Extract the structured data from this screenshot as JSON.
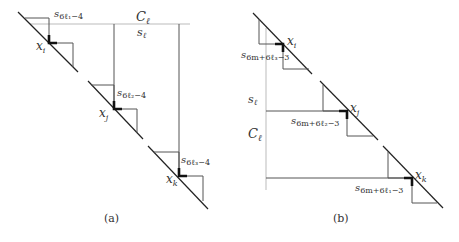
{
  "panel_a": {
    "caption": "(a)",
    "top_label": "C",
    "top_label_sub": "ℓ",
    "axis_label": "s",
    "axis_label_sub": "ℓ",
    "points": [
      {
        "name": "x",
        "sub": "i",
        "s_label": "s",
        "s_sub": "6ℓ₁−4"
      },
      {
        "name": "x",
        "sub": "j",
        "s_label": "s",
        "s_sub": "6ℓ₂−4"
      },
      {
        "name": "x",
        "sub": "k",
        "s_label": "s",
        "s_sub": "6ℓ₃−4"
      }
    ]
  },
  "panel_b": {
    "caption": "(b)",
    "side_label": "C",
    "side_label_sub": "ℓ",
    "axis_label": "s",
    "axis_label_sub": "ℓ",
    "points": [
      {
        "name": "x",
        "sub": "i",
        "s_label": "s",
        "s_sub": "6m+6ℓ₃−3"
      },
      {
        "name": "x",
        "sub": "j",
        "s_label": "s",
        "s_sub": "6m+6ℓ₂−3"
      },
      {
        "name": "x",
        "sub": "k",
        "s_label": "s",
        "s_sub": "6m+6ℓ₁−3"
      }
    ]
  }
}
